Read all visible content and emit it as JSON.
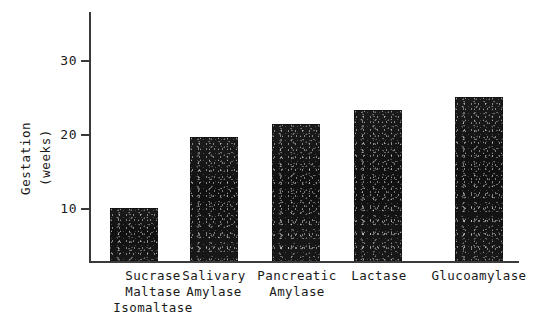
{
  "chart_data": {
    "type": "bar",
    "title": "",
    "subtitle": "",
    "xlabel": "",
    "ylabel": "Gestation (weeks)",
    "ylabel_lines": [
      "Gestation",
      "(weeks)"
    ],
    "categories": [
      "Sucrase Maltase Isomaltase",
      "Salivary Amylase",
      "Pancreatic Amylase",
      "Lactase",
      "Glucoamylase"
    ],
    "category_lines": [
      [
        "Sucrase",
        "Maltase",
        "Isomaltase"
      ],
      [
        "Salivary",
        "Amylase"
      ],
      [
        "Pancreatic",
        "Amylase"
      ],
      [
        "Lactase"
      ],
      [
        "Glucoamylase"
      ]
    ],
    "values": [
      10,
      19.6,
      21.3,
      23.2,
      25
    ],
    "ylim": [
      2.8,
      33.5
    ],
    "yticks": [
      10,
      20,
      30
    ],
    "ytick_labels": [
      "10",
      "20",
      "30"
    ],
    "grid": false,
    "legend": null,
    "bar_color": "#141414",
    "axis_color": "#3a3a3a",
    "annotations": []
  },
  "axis": {
    "ytick_labels": [
      "30",
      "20",
      "10"
    ]
  }
}
